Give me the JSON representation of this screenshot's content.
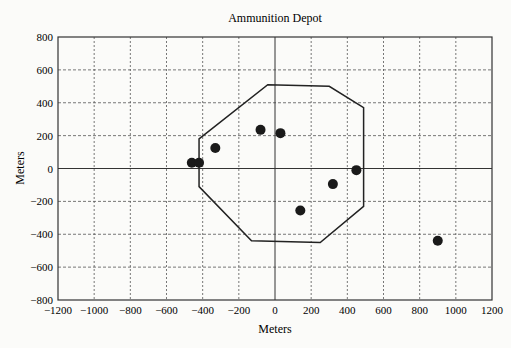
{
  "chart_data": {
    "type": "scatter",
    "title": "Ammunition Depot",
    "xlabel": "Meters",
    "ylabel": "Meters",
    "xlim": [
      -1200,
      1200
    ],
    "ylim": [
      -800,
      800
    ],
    "grid": true,
    "legend": null,
    "x_ticks": [
      -1200,
      -1000,
      -800,
      -600,
      -400,
      -200,
      0,
      200,
      400,
      600,
      800,
      1000,
      1200
    ],
    "y_ticks": [
      -800,
      -600,
      -400,
      -200,
      0,
      200,
      400,
      600,
      800
    ],
    "series": [
      {
        "name": "points",
        "type": "scatter",
        "points": [
          {
            "x": -460,
            "y": 35
          },
          {
            "x": -420,
            "y": 35
          },
          {
            "x": -330,
            "y": 125
          },
          {
            "x": -80,
            "y": 235
          },
          {
            "x": 30,
            "y": 215
          },
          {
            "x": 140,
            "y": -255
          },
          {
            "x": 320,
            "y": -95
          },
          {
            "x": 450,
            "y": -10
          },
          {
            "x": 900,
            "y": -440
          }
        ]
      },
      {
        "name": "depot boundary",
        "type": "polygon",
        "points": [
          {
            "x": -420,
            "y": 180
          },
          {
            "x": -40,
            "y": 510
          },
          {
            "x": 300,
            "y": 500
          },
          {
            "x": 490,
            "y": 370
          },
          {
            "x": 490,
            "y": -230
          },
          {
            "x": 250,
            "y": -450
          },
          {
            "x": -130,
            "y": -440
          },
          {
            "x": -420,
            "y": -110
          }
        ]
      }
    ]
  }
}
